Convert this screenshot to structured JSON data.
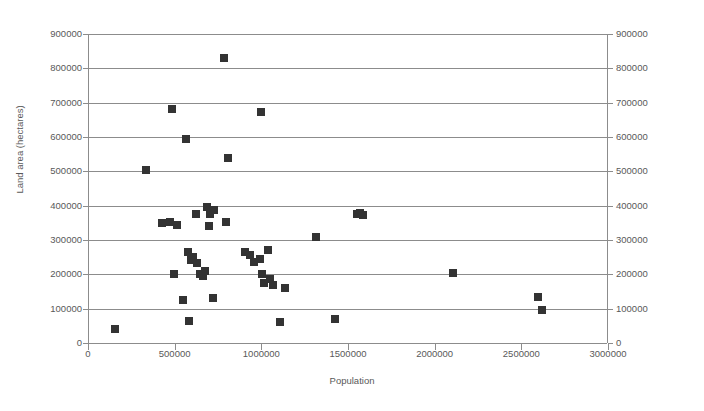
{
  "chart_data": {
    "type": "scatter",
    "title": "",
    "xlabel": "Population",
    "ylabel": "Land area (hectares)",
    "xlim": [
      0,
      3000000
    ],
    "ylim": [
      0,
      900000
    ],
    "xticks": [
      0,
      500000,
      1000000,
      1500000,
      2000000,
      2500000,
      3000000
    ],
    "xtick_labels": [
      "0",
      "500000",
      "1000000",
      "1500000",
      "2000000",
      "2500000",
      "3000000"
    ],
    "yticks": [
      0,
      100000,
      200000,
      300000,
      400000,
      500000,
      600000,
      700000,
      800000,
      900000
    ],
    "ytick_labels": [
      "0",
      "100000",
      "200000",
      "300000",
      "400000",
      "500000",
      "600000",
      "700000",
      "800000",
      "900000"
    ],
    "right_axis": true,
    "right_ytick_labels": [
      "0",
      "100000",
      "200000",
      "300000",
      "400000",
      "500000",
      "600000",
      "700000",
      "800000",
      "900000"
    ],
    "grid": "horizontal",
    "legend": "none",
    "marker": "square",
    "marker_color": "#333333",
    "grid_color": "#8c8c8c",
    "series": [
      {
        "name": "Regions",
        "points": [
          [
            150000,
            42000
          ],
          [
            330000,
            505000
          ],
          [
            420000,
            350000
          ],
          [
            465000,
            352000
          ],
          [
            480000,
            682000
          ],
          [
            490000,
            200000
          ],
          [
            505000,
            345000
          ],
          [
            540000,
            125000
          ],
          [
            560000,
            595000
          ],
          [
            570000,
            265000
          ],
          [
            575000,
            63000
          ],
          [
            590000,
            243000
          ],
          [
            600000,
            250000
          ],
          [
            615000,
            375000
          ],
          [
            625000,
            232000
          ],
          [
            640000,
            200000
          ],
          [
            660000,
            195000
          ],
          [
            670000,
            210000
          ],
          [
            680000,
            395000
          ],
          [
            695000,
            340000
          ],
          [
            700000,
            375000
          ],
          [
            715000,
            130000
          ],
          [
            720000,
            387000
          ],
          [
            780000,
            830000
          ],
          [
            790000,
            352000
          ],
          [
            800000,
            540000
          ],
          [
            900000,
            265000
          ],
          [
            930000,
            255000
          ],
          [
            950000,
            235000
          ],
          [
            985000,
            245000
          ],
          [
            990000,
            672000
          ],
          [
            1000000,
            200000
          ],
          [
            1010000,
            175000
          ],
          [
            1030000,
            272000
          ],
          [
            1045000,
            185000
          ],
          [
            1060000,
            170000
          ],
          [
            1100000,
            62000
          ],
          [
            1130000,
            160000
          ],
          [
            1310000,
            310000
          ],
          [
            1420000,
            70000
          ],
          [
            1545000,
            375000
          ],
          [
            1565000,
            378000
          ],
          [
            1580000,
            372000
          ],
          [
            2100000,
            205000
          ],
          [
            2590000,
            135000
          ],
          [
            2615000,
            95000
          ]
        ]
      }
    ]
  }
}
